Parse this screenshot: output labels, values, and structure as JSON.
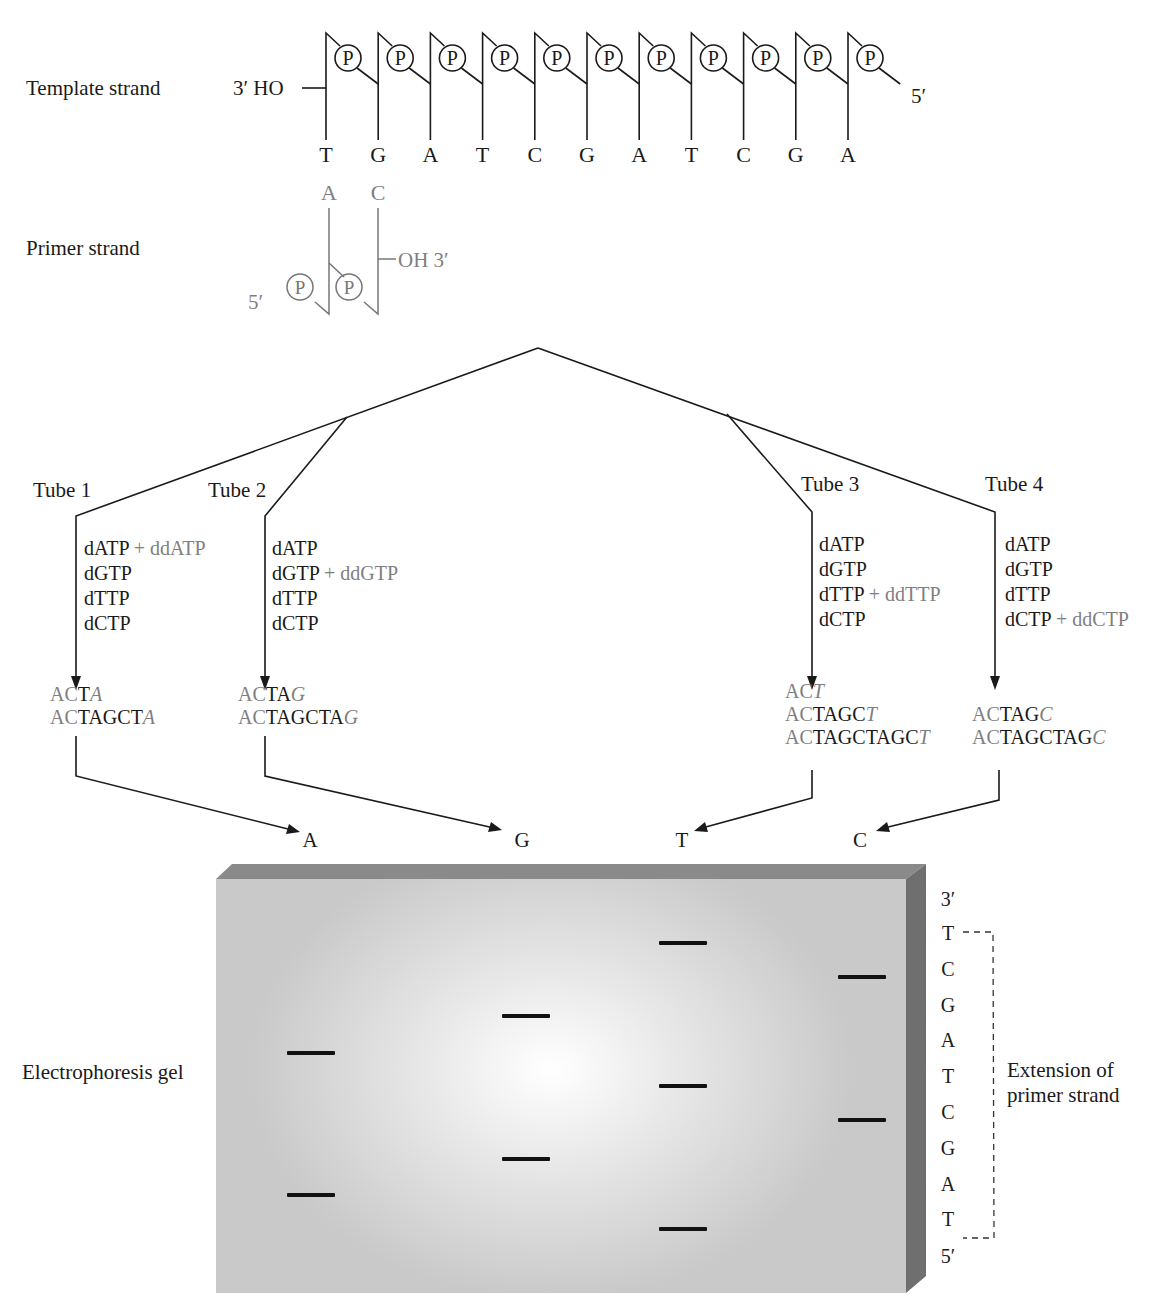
{
  "template": {
    "label": "Template strand",
    "end_3": "3′ HO",
    "end_5": "5′",
    "phosphate": "P",
    "bases": [
      "T",
      "G",
      "A",
      "T",
      "C",
      "G",
      "A",
      "T",
      "C",
      "G",
      "A"
    ]
  },
  "primer": {
    "label": "Primer strand",
    "end_5": "5′",
    "end_3": "OH 3′",
    "phosphate": "P",
    "bases": [
      "A",
      "C"
    ]
  },
  "tubes": [
    {
      "label": "Tube 1",
      "mix": [
        "dATP",
        "dGTP",
        "dTTP",
        "dCTP"
      ],
      "dd_row": 0,
      "dd": "+ ddATP",
      "products": [
        {
          "prefix": "AC",
          "body": "T",
          "end": "A"
        },
        {
          "prefix": "AC",
          "body": "TAGCT",
          "end": "A"
        }
      ]
    },
    {
      "label": "Tube 2",
      "mix": [
        "dATP",
        "dGTP",
        "dTTP",
        "dCTP"
      ],
      "dd_row": 1,
      "dd": "+ ddGTP",
      "products": [
        {
          "prefix": "AC",
          "body": "TA",
          "end": "G"
        },
        {
          "prefix": "AC",
          "body": "TAGCTA",
          "end": "G"
        }
      ]
    },
    {
      "label": "Tube 3",
      "mix": [
        "dATP",
        "dGTP",
        "dTTP",
        "dCTP"
      ],
      "dd_row": 2,
      "dd": "+ ddTTP",
      "products": [
        {
          "prefix": "AC",
          "body": "",
          "end": "T"
        },
        {
          "prefix": "AC",
          "body": "TAGC",
          "end": "T"
        },
        {
          "prefix": "AC",
          "body": "TAGCTAGC",
          "end": "T"
        }
      ]
    },
    {
      "label": "Tube 4",
      "mix": [
        "dATP",
        "dGTP",
        "dTTP",
        "dCTP"
      ],
      "dd_row": 3,
      "dd": "+ ddCTP",
      "products": [
        {
          "prefix": "AC",
          "body": "TAG",
          "end": "C"
        },
        {
          "prefix": "AC",
          "body": "TAGCTAG",
          "end": "C"
        }
      ]
    }
  ],
  "gel": {
    "label": "Electrophoresis gel",
    "lanes": [
      "A",
      "G",
      "T",
      "C"
    ],
    "sequence_top": "3′",
    "sequence": [
      "T",
      "C",
      "G",
      "A",
      "T",
      "C",
      "G",
      "A",
      "T"
    ],
    "sequence_bottom": "5′",
    "bracket_label_1": "Extension of",
    "bracket_label_2": "primer strand",
    "colors": {
      "band": "#111111",
      "gel_edge": "#8a8a8a",
      "gel_side": "#6f6f6f"
    }
  }
}
